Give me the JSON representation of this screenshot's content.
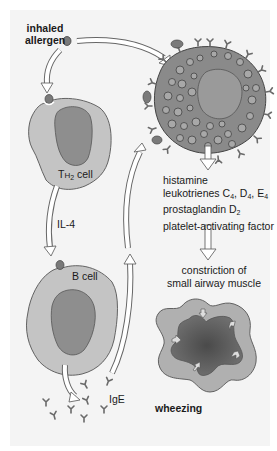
{
  "diagram": {
    "labels": {
      "inhaled_allergen_line1": "inhaled",
      "inhaled_allergen_line2": "allergen",
      "th2_prefix": "T",
      "th2_H": "H",
      "th2_sub": "2",
      "th2_suffix": " cell",
      "il4": "IL-4",
      "b_cell": "B cell",
      "ige": "IgE",
      "mediators": [
        {
          "text": "histamine"
        },
        {
          "text": "leukotrienes C",
          "subs": [
            "4",
            "4",
            "4"
          ],
          "parts": [
            "leukotrienes C",
            ", D",
            ", E"
          ]
        },
        {
          "parts": [
            "prostaglandin D"
          ],
          "subs": [
            "2"
          ]
        },
        {
          "text": "platelet-activating factor"
        }
      ],
      "mediator_line1": "histamine",
      "mediator_line2_a": "leukotrienes C",
      "mediator_line2_b": ", D",
      "mediator_line2_c": ", E",
      "mediator_line2_sub": "4",
      "mediator_line3_a": "prostaglandin D",
      "mediator_line3_sub": "2",
      "mediator_line4": "platelet-activating factor",
      "constriction_line1": "constriction of",
      "constriction_line2": "small airway muscle",
      "wheezing": "wheezing"
    },
    "nodes": [
      "inhaled allergen",
      "TH2 cell",
      "B cell",
      "IgE",
      "mast cell",
      "mediators",
      "airway",
      "wheezing"
    ],
    "colors": {
      "background": "#f4f4f4",
      "cell_fill": "#c4c4c4",
      "nucleus_fill": "#8e8e8e",
      "outline": "#555555",
      "allergen": "#7a7a7a",
      "mast_cell_fill": "#8a8a8a",
      "granule": "#9c9c9c",
      "airway_outer": "#b0b0b0",
      "airway_lumen": "#5a5a5a"
    }
  }
}
